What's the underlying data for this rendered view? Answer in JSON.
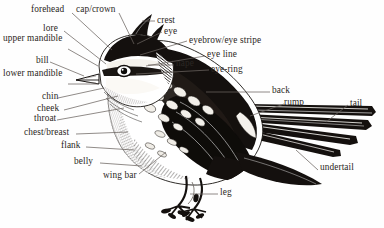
{
  "figure": {
    "kind": "bird-anatomy-diagram",
    "style": "black-and-white pen-and-ink engraving",
    "background_color": "#fefefe",
    "ink_color": "#1a1613",
    "text_color": "#2b2723",
    "leader_line_color": "#6b6460"
  },
  "labels": {
    "forehead": "forehead",
    "cap_crown": "cap/crown",
    "crest": "crest",
    "eye": "eye",
    "eyebrow_eye_stripe": "eyebrow/eye stripe",
    "lore": "lore",
    "eye_line": "eye line",
    "eye_ring": "eye-ring",
    "upper_mandible": "upper mandible",
    "nape": "nape",
    "bill": "bill",
    "lower_mandible": "lower mandible",
    "chin": "chin",
    "cheek": "cheek",
    "throat": "throat",
    "back": "back",
    "rump": "rump",
    "tail": "tail",
    "chest_breast": "chest/breast",
    "flank": "flank",
    "belly": "belly",
    "wing_bar": "wing bar",
    "undertail": "undertail",
    "leg": "leg"
  },
  "label_list": [
    {
      "id": "forehead",
      "text": "forehead",
      "x": 31,
      "y": 10,
      "anchor": "left"
    },
    {
      "id": "cap-crown",
      "text": "cap/crown",
      "x": 76,
      "y": 10,
      "anchor": "left"
    },
    {
      "id": "crest",
      "text": "crest",
      "x": 157,
      "y": 22,
      "anchor": "left"
    },
    {
      "id": "eye",
      "text": "eye",
      "x": 164,
      "y": 33,
      "anchor": "left"
    },
    {
      "id": "lore",
      "text": "lore",
      "x": 43,
      "y": 29,
      "anchor": "left"
    },
    {
      "id": "eyebrow-eye-stripe",
      "text": "eyebrow/eye stripe",
      "x": 189,
      "y": 41,
      "anchor": "left"
    },
    {
      "id": "upper-mandible",
      "text": "upper mandible",
      "x": 3,
      "y": 39,
      "anchor": "left"
    },
    {
      "id": "eye-line",
      "text": "eye line",
      "x": 207,
      "y": 55,
      "anchor": "left"
    },
    {
      "id": "nape",
      "text": "nape",
      "x": 176,
      "y": 64,
      "anchor": "left"
    },
    {
      "id": "eye-ring",
      "text": "eye-ring",
      "x": 211,
      "y": 70,
      "anchor": "left"
    },
    {
      "id": "bill",
      "text": "bill",
      "x": 36,
      "y": 61,
      "anchor": "left"
    },
    {
      "id": "lower-mandible",
      "text": "lower mandible",
      "x": 3,
      "y": 74,
      "anchor": "left"
    },
    {
      "id": "chin",
      "text": "chin",
      "x": 42,
      "y": 96,
      "anchor": "left"
    },
    {
      "id": "cheek",
      "text": "cheek",
      "x": 37,
      "y": 107,
      "anchor": "left"
    },
    {
      "id": "back",
      "text": "back",
      "x": 272,
      "y": 90,
      "anchor": "left"
    },
    {
      "id": "throat",
      "text": "throat",
      "x": 34,
      "y": 118,
      "anchor": "left"
    },
    {
      "id": "rump",
      "text": "rump",
      "x": 284,
      "y": 101,
      "anchor": "left"
    },
    {
      "id": "tail",
      "text": "tail",
      "x": 350,
      "y": 103,
      "anchor": "left"
    },
    {
      "id": "chest-breast",
      "text": "chest/breast",
      "x": 24,
      "y": 132,
      "anchor": "left"
    },
    {
      "id": "flank",
      "text": "flank",
      "x": 61,
      "y": 145,
      "anchor": "left"
    },
    {
      "id": "belly",
      "text": "belly",
      "x": 74,
      "y": 161,
      "anchor": "left"
    },
    {
      "id": "wing-bar",
      "text": "wing bar",
      "x": 103,
      "y": 176,
      "anchor": "left"
    },
    {
      "id": "undertail",
      "text": "undertail",
      "x": 320,
      "y": 168,
      "anchor": "left"
    },
    {
      "id": "leg",
      "text": "leg",
      "x": 220,
      "y": 192,
      "anchor": "left"
    }
  ]
}
